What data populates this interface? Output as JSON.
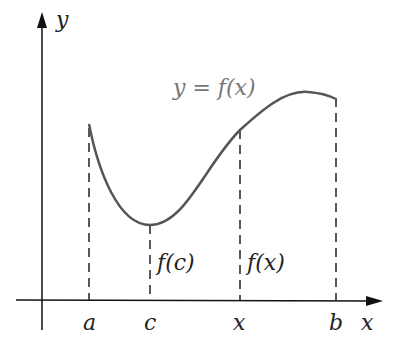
{
  "diagram": {
    "type": "function-graph",
    "axes": {
      "x_label": "x",
      "y_label": "y"
    },
    "curve_label": "y = f(x)",
    "x_ticks": [
      {
        "label": "a",
        "px": 89
      },
      {
        "label": "c",
        "px": 150
      },
      {
        "label": "x",
        "px": 240
      },
      {
        "label": "b",
        "px": 336
      }
    ],
    "value_labels": {
      "fc": "f(c)",
      "fx": "f(x)"
    },
    "colors": {
      "axis": "#111111",
      "curve": "#555555",
      "dashed": "#222222",
      "curve_label": "#777777"
    }
  }
}
